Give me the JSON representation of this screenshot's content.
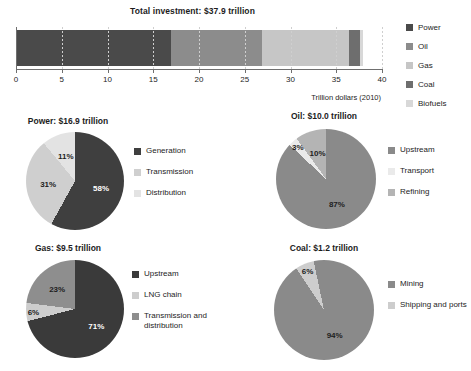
{
  "chart_data": [
    {
      "type": "bar",
      "orientation": "horizontal",
      "stacked": true,
      "title": "Total investment: $37.9 trillion",
      "xlabel": "Trillion dollars (2010)",
      "ylabel": "",
      "xlim": [
        0,
        40
      ],
      "xticks": [
        "0",
        "5",
        "10",
        "15",
        "20",
        "25",
        "30",
        "35",
        "40"
      ],
      "grid": true,
      "legend_position": "right",
      "categories": [
        "Power",
        "Oil",
        "Gas",
        "Coal",
        "Biofuels"
      ],
      "values": [
        16.9,
        10.0,
        9.5,
        1.2,
        0.3
      ],
      "colors": [
        "#4a4a4a",
        "#8c8c8c",
        "#c6c6c6",
        "#6e6e6e",
        "#d8d8d8"
      ]
    },
    {
      "type": "pie",
      "title": "Power: $16.9 trillion",
      "categories": [
        "Generation",
        "Transmission",
        "Distribution"
      ],
      "values": [
        58,
        31,
        11
      ],
      "labels": [
        "58%",
        "31%",
        "11%"
      ],
      "colors": [
        "#3f3f3f",
        "#cfcfcf",
        "#e3e3e3"
      ]
    },
    {
      "type": "pie",
      "title": "Oil: $10.0 trillion",
      "categories": [
        "Upstream",
        "Transport",
        "Refining"
      ],
      "values": [
        87,
        3,
        10
      ],
      "labels": [
        "87%",
        "3%",
        "10%"
      ],
      "colors": [
        "#8a8a8a",
        "#eaeaea",
        "#b4b4b4"
      ]
    },
    {
      "type": "pie",
      "title": "Gas: $9.5 trillion",
      "categories": [
        "Upstream",
        "LNG chain",
        "Transmission and distribution"
      ],
      "values": [
        71,
        6,
        23
      ],
      "labels": [
        "71%",
        "6%",
        "23%"
      ],
      "colors": [
        "#3a3a3a",
        "#cdcdcd",
        "#8e8e8e"
      ]
    },
    {
      "type": "pie",
      "title": "Coal: $1.2 trillion",
      "categories": [
        "Mining",
        "Shipping and ports"
      ],
      "values": [
        94,
        6
      ],
      "labels": [
        "94%",
        "6%"
      ],
      "colors": [
        "#8a8a8a",
        "#cdcdcd"
      ]
    }
  ],
  "bar": {
    "title": "Total investment: $37.9 trillion",
    "axis_caption": "Trillion dollars (2010)",
    "ticks": [
      "0",
      "5",
      "10",
      "15",
      "20",
      "25",
      "30",
      "35",
      "40"
    ],
    "segments": [
      {
        "label": "Power",
        "value": 16.9,
        "color": "#4a4a4a"
      },
      {
        "label": "Oil",
        "value": 10.0,
        "color": "#8c8c8c"
      },
      {
        "label": "Gas",
        "value": 9.5,
        "color": "#c6c6c6"
      },
      {
        "label": "Coal",
        "value": 1.2,
        "color": "#6e6e6e"
      },
      {
        "label": "Biofuels",
        "value": 0.3,
        "color": "#d8d8d8"
      }
    ],
    "legend": [
      {
        "label": "Power",
        "color": "#4a4a4a"
      },
      {
        "label": "Oil",
        "color": "#8c8c8c"
      },
      {
        "label": "Gas",
        "color": "#c6c6c6"
      },
      {
        "label": "Coal",
        "color": "#6e6e6e"
      },
      {
        "label": "Biofuels",
        "color": "#d8d8d8"
      }
    ]
  },
  "pies": {
    "power": {
      "title": "Power: $16.9 trillion",
      "slices": [
        {
          "label": "Generation",
          "value": 58,
          "display": "58%",
          "color": "#3f3f3f"
        },
        {
          "label": "Transmission",
          "value": 31,
          "display": "31%",
          "color": "#cfcfcf"
        },
        {
          "label": "Distribution",
          "value": 11,
          "display": "11%",
          "color": "#e3e3e3"
        }
      ]
    },
    "oil": {
      "title": "Oil: $10.0 trillion",
      "slices": [
        {
          "label": "Upstream",
          "value": 87,
          "display": "87%",
          "color": "#8a8a8a"
        },
        {
          "label": "Transport",
          "value": 3,
          "display": "3%",
          "color": "#eaeaea"
        },
        {
          "label": "Refining",
          "value": 10,
          "display": "10%",
          "color": "#b4b4b4"
        }
      ]
    },
    "gas": {
      "title": "Gas: $9.5 trillion",
      "slices": [
        {
          "label": "Upstream",
          "value": 71,
          "display": "71%",
          "color": "#3a3a3a"
        },
        {
          "label": "LNG chain",
          "value": 6,
          "display": "6%",
          "color": "#cdcdcd"
        },
        {
          "label": "Transmission and distribution",
          "value": 23,
          "display": "23%",
          "color": "#8e8e8e"
        }
      ]
    },
    "coal": {
      "title": "Coal: $1.2 trillion",
      "slices": [
        {
          "label": "Mining",
          "value": 94,
          "display": "94%",
          "color": "#8a8a8a"
        },
        {
          "label": "Shipping and ports",
          "value": 6,
          "display": "6%",
          "color": "#cdcdcd"
        }
      ]
    }
  }
}
